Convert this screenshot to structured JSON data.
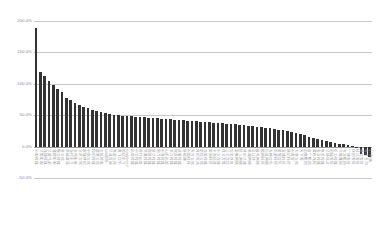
{
  "chart": {
    "title": "",
    "y_axis": {
      "ticks": [
        "200.0%",
        "150.0%",
        "100.0%",
        "50.0%",
        "0.0%",
        "-50.0%"
      ]
    }
  },
  "chart_data": {
    "type": "bar",
    "title": "",
    "subtitle": "",
    "xlabel": "",
    "ylabel": "",
    "ylim": [
      -50,
      200
    ],
    "ytick_values": [
      200,
      150,
      100,
      50,
      0,
      -50
    ],
    "ytick_labels": [
      "200.0%",
      "150.0%",
      "100.0%",
      "50.0%",
      "0.0%",
      "-50.0%"
    ],
    "grid": true,
    "legend": null,
    "legend_position": "none",
    "bar_color": "#333333",
    "sorted": "descending",
    "categories": [
      "中视传媒",
      "华策影视",
      "光线传媒",
      "华谊兄弟",
      "唐德影视",
      "慈文传媒",
      "新文化",
      "幸福蓝海",
      "当代东方",
      "长城影视",
      "北京文化",
      "欢瑞世纪",
      "中南文化",
      "印纪传媒",
      "鹿港文化",
      "文投控股",
      "star国际",
      "华录百纳",
      "骅威文化",
      "奥飞娱乐",
      "恒信东方",
      "completed",
      "出版传媒",
      "中文传媒",
      "时代出版",
      "凤凰传媒",
      "皖新传媒",
      "新华传媒",
      "南方传媒",
      "中原传媒",
      "山东出版",
      "长江传媒",
      "城市传媒",
      "读者传媒",
      "新经典",
      "中国科传",
      "天舟文化",
      "世纪天鸿",
      "荣信文化",
      "龙版传媒",
      "掌阅科技",
      "平治信息",
      "中文在线",
      "昆仑万维",
      "三七互娱",
      "完美世界",
      "游族网络",
      "巨人网络",
      "世纪华通",
      "电魂网络",
      "吉比特",
      "盛天网络",
      "顺网科技",
      "恺英网络",
      "天神娱乐",
      "迅游科技",
      "星辉娱乐",
      "宝通科技",
      "姚记科技",
      "中青宝",
      "大晟文化",
      "天下秀",
      "因赛集团",
      "省广集团",
      "蓝色光标",
      "分众传媒",
      "思美传媒",
      "华扬联众",
      "利欧股份",
      "引力传媒",
      "元隆雅图",
      "天龙集团",
      "广博股份",
      "联创股份",
      "科达股份",
      "腾信股份",
      "每日互动",
      "ST明诚"
    ],
    "values": [
      189.0,
      118.0,
      112.0,
      104.0,
      98.0,
      92.0,
      87.0,
      78.0,
      74.0,
      69.0,
      66.0,
      63.0,
      61.0,
      59.0,
      57.0,
      55.0,
      53.0,
      52.0,
      51.0,
      50.0,
      49.5,
      49.0,
      48.0,
      47.5,
      47.0,
      46.5,
      46.0,
      45.5,
      45.0,
      44.5,
      44.0,
      43.5,
      43.0,
      42.5,
      42.0,
      41.5,
      41.0,
      40.0,
      39.5,
      39.0,
      38.5,
      38.0,
      37.5,
      37.0,
      36.5,
      36.0,
      35.5,
      35.0,
      34.0,
      33.5,
      33.0,
      32.0,
      31.0,
      30.0,
      29.0,
      28.0,
      27.0,
      26.0,
      24.5,
      23.0,
      21.5,
      20.0,
      18.0,
      16.0,
      14.0,
      12.0,
      10.0,
      8.5,
      7.0,
      5.5,
      4.5,
      3.5,
      2.0,
      1.0,
      -2.0,
      -12.0,
      -13.5,
      -17.0
    ]
  }
}
